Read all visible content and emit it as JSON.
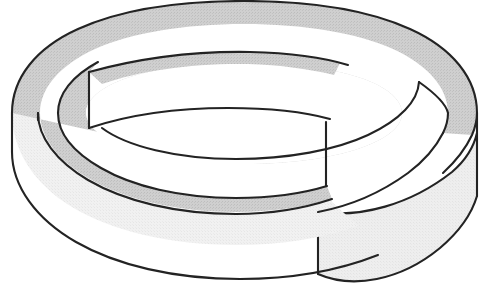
{
  "figure": {
    "title": "Twisted band (Möbius-style strip)",
    "type": "line-drawing",
    "canvas": {
      "width": 492,
      "height": 294,
      "background": "#ffffff"
    },
    "caption": "",
    "colors": {
      "background": "#ffffff",
      "top_surface_gray": "#c9c9c9",
      "outer_wall_gray": "#f0f0f0",
      "lower_strip_gray": "#ededed",
      "inner_hole_white": "#ffffff",
      "outline_black": "#232323"
    },
    "parts": [
      {
        "id": "top-annulus-surface",
        "label": "Top surface of band",
        "shade": "#c9c9c9",
        "description": "Shaded upper face of the looping strip seen in perspective"
      },
      {
        "id": "outer-wall",
        "label": "Outer wall of band",
        "shade": "#f0f0f0",
        "description": "Light vertical side face of the ring, front-facing"
      },
      {
        "id": "inner-hole",
        "label": "Inner opening",
        "shade": "#ffffff",
        "description": "White elliptical hole at the centre of the loop"
      },
      {
        "id": "upper-free-end",
        "label": "Upper cut end",
        "shade": "#c9c9c9",
        "description": "Free end of the strip overlapping above, with vertical cut edge"
      },
      {
        "id": "lower-free-end",
        "label": "Lower cut end",
        "shade": "#ededed",
        "description": "Free end of the strip passing below at the lower right"
      }
    ],
    "geometry": {
      "outer_ellipse": {
        "cx": 244,
        "cy": 118,
        "rx": 232,
        "ry": 90
      },
      "inner_ellipse": {
        "cx": 244,
        "cy": 130,
        "rx": 172,
        "ry": 62
      },
      "band_wall_height": 84,
      "perspective": "viewed from slightly above, loop lying nearly horizontal"
    }
  }
}
